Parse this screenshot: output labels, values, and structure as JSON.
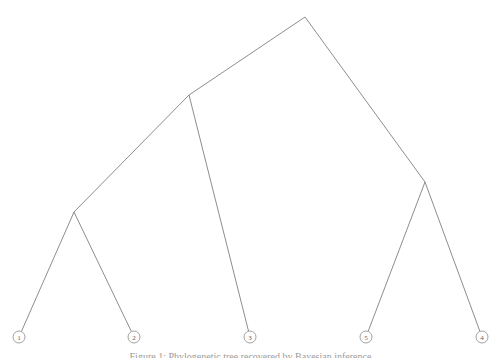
{
  "figure": {
    "caption": "Figure 1: Phylogenetic tree recovered by Bayesian inference",
    "background_color": "#ffffff",
    "line_color": "#808080",
    "node_stroke_color": "#8a8a8a",
    "label_color": "#5e5e5e"
  },
  "chart_data": {
    "type": "diagram",
    "subtype": "phylogenetic-tree",
    "title": "",
    "xlabel": "",
    "ylabel": "",
    "grid": false,
    "legend": "none",
    "viewbox": [
      0,
      0,
      501,
      358
    ],
    "leaf_order": [
      "1",
      "2",
      "3",
      "5",
      "4"
    ],
    "nodes": [
      {
        "id": "root",
        "label": "",
        "type": "internal",
        "x": 305,
        "y": 17
      },
      {
        "id": "n_left",
        "label": "",
        "type": "internal",
        "x": 189,
        "y": 95
      },
      {
        "id": "n_leftlow",
        "label": "",
        "type": "internal",
        "x": 74,
        "y": 212
      },
      {
        "id": "n_right",
        "label": "",
        "type": "internal",
        "x": 425,
        "y": 182
      },
      {
        "id": "leaf1",
        "label": "1",
        "type": "leaf",
        "x": 19,
        "y": 337
      },
      {
        "id": "leaf2",
        "label": "2",
        "type": "leaf",
        "x": 134,
        "y": 337
      },
      {
        "id": "leaf3",
        "label": "3",
        "type": "leaf",
        "x": 250,
        "y": 337
      },
      {
        "id": "leaf5",
        "label": "5",
        "type": "leaf",
        "x": 366,
        "y": 337
      },
      {
        "id": "leaf4",
        "label": "4",
        "type": "leaf",
        "x": 482,
        "y": 337
      }
    ],
    "edges": [
      {
        "from": "root",
        "to": "n_left"
      },
      {
        "from": "root",
        "to": "n_right"
      },
      {
        "from": "n_left",
        "to": "n_leftlow"
      },
      {
        "from": "n_left",
        "to": "leaf3"
      },
      {
        "from": "n_leftlow",
        "to": "leaf1"
      },
      {
        "from": "n_leftlow",
        "to": "leaf2"
      },
      {
        "from": "n_right",
        "to": "leaf5"
      },
      {
        "from": "n_right",
        "to": "leaf4"
      }
    ],
    "leaf_radius": 6
  }
}
